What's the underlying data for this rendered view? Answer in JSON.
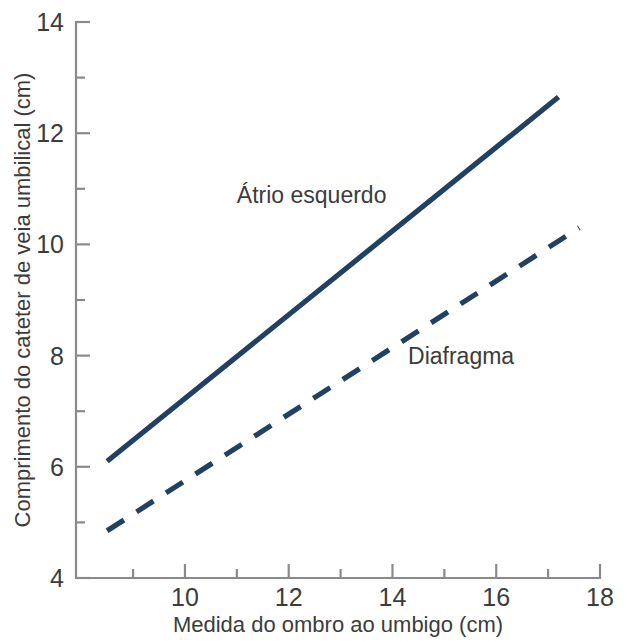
{
  "chart_data": {
    "type": "line",
    "title": "",
    "xlabel": "Medida do ombro ao umbigo (cm)",
    "ylabel": "Comprimento do cateter de veia umbilical (cm)",
    "xlim": [
      7.9,
      18
    ],
    "ylim": [
      4,
      14
    ],
    "grid": false,
    "legend_position": "inline-annotation",
    "x_ticks_major": [
      10,
      12,
      14,
      16,
      18
    ],
    "x_ticks_minor": [
      9,
      11,
      13,
      15,
      17
    ],
    "x_tick_labels": [
      "10",
      "12",
      "14",
      "16",
      "18"
    ],
    "y_ticks_major": [
      4,
      6,
      8,
      10,
      12,
      14
    ],
    "y_ticks_minor": [
      5,
      7,
      9,
      11,
      13
    ],
    "y_tick_labels": [
      "4",
      "6",
      "8",
      "10",
      "12",
      "14"
    ],
    "series": [
      {
        "name": "Átrio esquerdo",
        "style": "solid",
        "color": "#214062",
        "x": [
          8.5,
          17.2
        ],
        "values": [
          6.1,
          12.65
        ],
        "annotation": "Átrio esquerdo"
      },
      {
        "name": "Diafragma",
        "style": "dashed",
        "color": "#214062",
        "x": [
          8.5,
          17.6
        ],
        "values": [
          4.85,
          10.3
        ],
        "annotation": "Diafragma"
      }
    ],
    "annotations": [
      {
        "text": "Átrio esquerdo",
        "x": 11.0,
        "y": 10.75
      },
      {
        "text": "Diafragma",
        "x": 14.3,
        "y": 7.85
      }
    ]
  },
  "axis": {
    "color": "#8a8a8a"
  }
}
